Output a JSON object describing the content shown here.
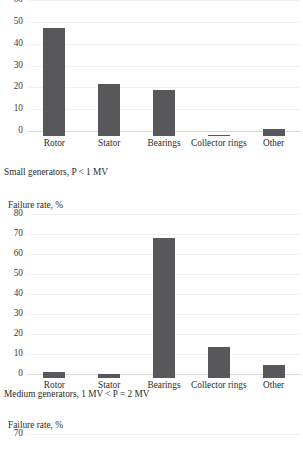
{
  "page": {
    "background": "#ffffff",
    "bar_color": "#58585a",
    "grid_color": "#f2f2f2",
    "axis_color": "#d8d8d8",
    "text_color": "#2b2b2b"
  },
  "chart_data": [
    {
      "id": "chart-small-generators",
      "type": "bar",
      "title": "",
      "xlabel": "",
      "ylabel": "",
      "categories": [
        "Rotor",
        "Stator",
        "Bearings",
        "Collector rings",
        "Other"
      ],
      "values": [
        49.5,
        24,
        21,
        0.5,
        3
      ],
      "yticks": [
        0,
        10,
        20,
        30,
        40,
        50,
        60
      ],
      "ylim": [
        0,
        60
      ],
      "grid": true,
      "legend": "none",
      "caption": "Small generators, P < 1 MV"
    },
    {
      "id": "chart-medium-generators",
      "type": "bar",
      "title": "Failure rate, %",
      "xlabel": "",
      "ylabel": "Failure rate, %",
      "categories": [
        "Rotor",
        "Stator",
        "Bearings",
        "Collector rings",
        "Other"
      ],
      "values": [
        3,
        2,
        70,
        15.5,
        6.5
      ],
      "yticks": [
        0,
        10,
        20,
        30,
        40,
        50,
        60,
        70,
        80
      ],
      "ylim": [
        0,
        80
      ],
      "grid": true,
      "legend": "none",
      "caption": "Medium generators, 1 MV < P = 2 MV"
    },
    {
      "id": "chart-third-partial",
      "type": "bar",
      "title": "Failure rate, %",
      "xlabel": "",
      "ylabel": "Failure rate, %",
      "categories": [],
      "values": [],
      "yticks": [
        70
      ],
      "ylim": [
        0,
        70
      ],
      "grid": true,
      "legend": "none",
      "caption": ""
    }
  ],
  "charts": [
    {
      "axis_title": "",
      "yticks": [
        "60",
        "50",
        "40",
        "30",
        "20",
        "10",
        "0"
      ],
      "categories": [
        "Rotor",
        "Stator",
        "Bearings",
        "Collector rings",
        "Other"
      ],
      "caption": "Small generators, P < 1 MV"
    },
    {
      "axis_title": "Failure rate, %",
      "yticks": [
        "80",
        "70",
        "60",
        "50",
        "40",
        "30",
        "20",
        "10",
        "0"
      ],
      "categories": [
        "Rotor",
        "Stator",
        "Bearings",
        "Collector rings",
        "Other"
      ],
      "caption": "Medium generators, 1 MV < P = 2 MV"
    },
    {
      "axis_title": "Failure rate, %",
      "yticks": [
        "70"
      ],
      "categories": [],
      "caption": ""
    }
  ]
}
